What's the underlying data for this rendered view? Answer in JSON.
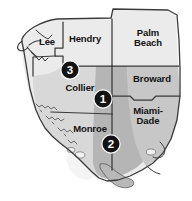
{
  "map": {
    "title": "South Florida counties map",
    "region": "South Florida",
    "colors": {
      "land_light": "#ebebeb",
      "land_mid": "#d8d8d8",
      "land_dark": "#b5b5b5",
      "water": "#ffffff",
      "outline": "#3a3a3a",
      "marker_fill": "#131313",
      "marker_text": "#ffffff",
      "label_text": "#111111"
    },
    "counties": [
      {
        "id": "lee",
        "label": "Lee",
        "x": 47,
        "y": 42,
        "shade": "land_light"
      },
      {
        "id": "hendry",
        "label": "Hendry",
        "x": 85,
        "y": 39,
        "shade": "land_light"
      },
      {
        "id": "palm-beach",
        "label": "Palm\nBeach",
        "x": 148,
        "y": 38,
        "shade": "land_light"
      },
      {
        "id": "broward",
        "label": "Broward",
        "x": 152,
        "y": 79,
        "shade": "land_light"
      },
      {
        "id": "miami-dade",
        "label": "Miami-\nDade",
        "x": 148,
        "y": 116,
        "shade": "land_light"
      },
      {
        "id": "collier",
        "label": "Collier",
        "x": 80,
        "y": 88,
        "shade": "land_mid"
      },
      {
        "id": "monroe",
        "label": "Monroe",
        "x": 90,
        "y": 129,
        "shade": "land_mid"
      }
    ],
    "markers": [
      {
        "id": "marker-3",
        "label": "3",
        "x": 70,
        "y": 70
      },
      {
        "id": "marker-1",
        "label": "1",
        "x": 103,
        "y": 99
      },
      {
        "id": "marker-2",
        "label": "2",
        "x": 111,
        "y": 144
      }
    ]
  }
}
